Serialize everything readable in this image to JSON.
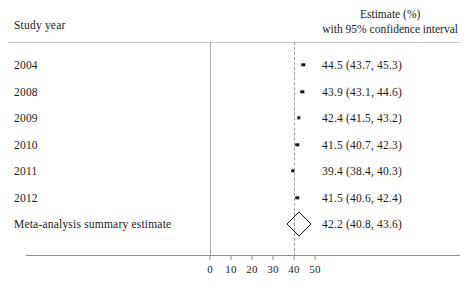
{
  "header": {
    "left_column_title": "Study year",
    "right_column_title_line1": "Estimate (%)",
    "right_column_title_line2": "with 95% confidence interval"
  },
  "chart_data": {
    "type": "forest",
    "title": "",
    "xlabel": "",
    "ylabel": "",
    "xlim": [
      -10,
      60
    ],
    "xticks": [
      0,
      10,
      20,
      30,
      40,
      50
    ],
    "xtick_labels": [
      "0",
      "10",
      "20",
      "30",
      "40",
      "50"
    ],
    "grid": false,
    "reference_line": 42.2,
    "reference_line_style": "dashed",
    "zero_line": 0,
    "categories": [
      "2004",
      "2008",
      "2009",
      "2010",
      "2011",
      "2012",
      "Meta-analysis summary estimate"
    ],
    "rows": [
      {
        "label": "2004",
        "estimate": 44.5,
        "ci_low": 43.7,
        "ci_high": 45.3,
        "value_text": "44.5 (43.7, 45.3)",
        "marker": "square",
        "is_summary": false
      },
      {
        "label": "2008",
        "estimate": 43.9,
        "ci_low": 43.1,
        "ci_high": 44.6,
        "value_text": "43.9 (43.1, 44.6)",
        "marker": "square",
        "is_summary": false
      },
      {
        "label": "2009",
        "estimate": 42.4,
        "ci_low": 41.5,
        "ci_high": 43.2,
        "value_text": "42.4 (41.5, 43.2)",
        "marker": "square",
        "is_summary": false
      },
      {
        "label": "2010",
        "estimate": 41.5,
        "ci_low": 40.7,
        "ci_high": 42.3,
        "value_text": "41.5 (40.7, 42.3)",
        "marker": "square",
        "is_summary": false
      },
      {
        "label": "2011",
        "estimate": 39.4,
        "ci_low": 38.4,
        "ci_high": 40.3,
        "value_text": "39.4 (38.4, 40.3)",
        "marker": "square",
        "is_summary": false
      },
      {
        "label": "2012",
        "estimate": 41.5,
        "ci_low": 40.6,
        "ci_high": 42.4,
        "value_text": "41.5 (40.6, 42.4)",
        "marker": "square",
        "is_summary": false
      },
      {
        "label": "Meta-analysis summary estimate",
        "estimate": 42.2,
        "ci_low": 40.8,
        "ci_high": 43.6,
        "value_text": "42.2 (40.8, 43.6)",
        "marker": "diamond",
        "is_summary": true
      }
    ]
  },
  "colors": {
    "text": "#1c1c1c",
    "marker": "#111111",
    "axis": "#8d8d8d",
    "rule": "#c9c9c9",
    "reference_line": "#9a9a9a",
    "background": "#ffffff"
  }
}
